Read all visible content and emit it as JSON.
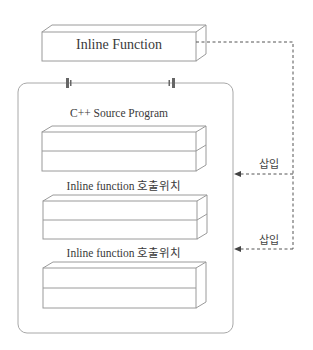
{
  "diagram": {
    "inline_function_box": {
      "label": "Inline Function"
    },
    "source_program": {
      "title": "C++ Source Program",
      "call_site_labels": [
        "Inline function 호출위치",
        "Inline function 호출위치"
      ]
    },
    "insert_arrows": [
      {
        "label": "삽입"
      },
      {
        "label": "삽입"
      }
    ],
    "colors": {
      "line": "#9a9a9a",
      "dash": "#555555",
      "text": "#3a3a3a"
    }
  }
}
